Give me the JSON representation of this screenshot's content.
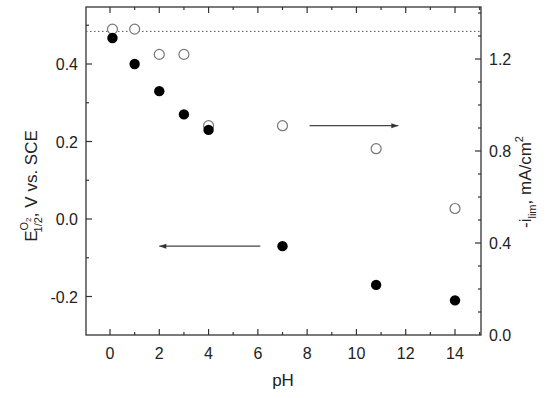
{
  "chart_data": {
    "type": "scatter",
    "title": "",
    "xlabel": "pH",
    "ylabel_left": {
      "main": "E",
      "superscript": "O2",
      "subscript": "1/2",
      "rest": ", V vs. SCE"
    },
    "ylabel_right": {
      "prefix": "-i",
      "subscript": "lim",
      "rest": ", mA/cm",
      "superscript": "2"
    },
    "xlim": [
      -1,
      15
    ],
    "ylim_left": [
      -0.3,
      0.55
    ],
    "ylim_right": [
      0.0,
      1.43
    ],
    "x_ticks": [
      0,
      2,
      4,
      6,
      8,
      10,
      12,
      14
    ],
    "x_tick_labels": [
      "0",
      "2",
      "4",
      "6",
      "8",
      "10",
      "12",
      "14"
    ],
    "y_left_ticks": [
      -0.2,
      0.0,
      0.2,
      0.4
    ],
    "y_left_tick_labels": [
      "-0.2",
      "0.0",
      "0.2",
      "0.4"
    ],
    "y_right_ticks": [
      0.0,
      0.4,
      0.8,
      1.2
    ],
    "y_right_tick_labels": [
      "0.0",
      "0.4",
      "0.8",
      "1.2"
    ],
    "grid": false,
    "series": [
      {
        "name": "E1/2 (O2)",
        "marker": "filled-circle",
        "axis": "left",
        "color": "#000000",
        "x": [
          0.1,
          1.0,
          2.0,
          3.0,
          4.0,
          7.0,
          10.8,
          14.0
        ],
        "values": [
          0.467,
          0.4,
          0.33,
          0.27,
          0.23,
          -0.07,
          -0.17,
          -0.21
        ]
      },
      {
        "name": "-i_lim",
        "marker": "open-circle",
        "axis": "right",
        "color": "#777777",
        "x": [
          0.1,
          1.0,
          2.0,
          3.0,
          4.0,
          7.0,
          10.8,
          14.0
        ],
        "values": [
          1.33,
          1.33,
          1.22,
          1.22,
          0.91,
          0.91,
          0.81,
          0.55
        ]
      }
    ],
    "reference_line": {
      "style": "dotted",
      "axis": "right",
      "value": 1.32
    },
    "annotations": [
      {
        "type": "arrow",
        "direction": "left",
        "from_x": 6.1,
        "to_x": 2.0,
        "y_left": -0.07,
        "meaning": "filled points read on left axis"
      },
      {
        "type": "arrow",
        "direction": "right",
        "from_x": 8.1,
        "to_x": 11.7,
        "y_right": 0.91,
        "meaning": "open points read on right axis"
      }
    ]
  }
}
